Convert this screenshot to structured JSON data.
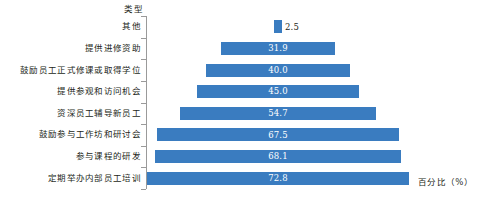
{
  "chart_data": {
    "type": "bar",
    "orientation": "horizontal",
    "subtype": "centered-funnel-pyramid",
    "title": "",
    "xlabel": "百分比（%）",
    "ylabel": "类型",
    "grid": false,
    "legend": "none",
    "xlim": [
      0,
      72.8
    ],
    "value_suffix": "%",
    "categories": [
      "其他",
      "提供进修资助",
      "鼓励员工正式修课或取得学位",
      "提供参观和访问机会",
      "资深员工辅导新员工",
      "鼓励参与工作坊和研讨会",
      "参与课程的研发",
      "定期举办内部员工培训"
    ],
    "values": [
      2.5,
      31.9,
      40.0,
      45.0,
      54.7,
      67.5,
      68.1,
      72.8
    ],
    "value_labels": [
      "2.5",
      "31.9",
      "40.0",
      "45.0",
      "54.7",
      "67.5",
      "68.1",
      "72.8"
    ],
    "colors": {
      "bar": "#3a7cc0",
      "value_label_inside": "#ffffff",
      "value_label_outside": "#231f20",
      "axis": "#9a9a9a",
      "text": "#231f20",
      "background": "#ffffff"
    }
  },
  "axes": {
    "category_axis_title": "类型",
    "value_axis_title": "百分比（%）"
  },
  "caption": {
    "text": ""
  }
}
